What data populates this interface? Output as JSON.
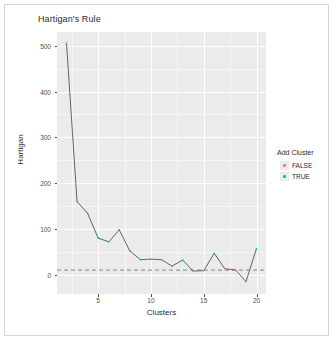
{
  "chart_data": {
    "type": "line",
    "title": "Hartigan's Rule",
    "xlabel": "Clusters",
    "ylabel": "Hartigan",
    "xlim": [
      1.1,
      20.9
    ],
    "ylim": [
      -42,
      530
    ],
    "xticks": [
      5,
      10,
      15,
      20
    ],
    "yticks": [
      0,
      100,
      200,
      300,
      400,
      500
    ],
    "grid": true,
    "legend": {
      "title": "Add Cluster",
      "position": "right",
      "entries": [
        {
          "label": "FALSE",
          "color": "#f8766d"
        },
        {
          "label": "TRUE",
          "color": "#00bfc4"
        }
      ]
    },
    "reference_line": {
      "y": 10,
      "style": "dashed",
      "color": "#999999"
    },
    "line_color": "#555555",
    "x": [
      2,
      3,
      4,
      5,
      6,
      7,
      8,
      9,
      10,
      11,
      12,
      13,
      14,
      15,
      16,
      17,
      18,
      19,
      20
    ],
    "values": [
      505,
      160,
      134,
      80,
      72,
      98,
      52,
      33,
      34,
      33,
      19,
      32,
      8,
      9,
      47,
      13,
      11,
      -15,
      57
    ],
    "series": [
      {
        "name": "Hartigan",
        "values": [
          505,
          160,
          134,
          80,
          72,
          98,
          52,
          33,
          34,
          33,
          19,
          32,
          8,
          9,
          47,
          13,
          11,
          -15,
          57
        ]
      }
    ],
    "point_groups": [
      {
        "add_cluster": "TRUE",
        "x": [
          2,
          3,
          4,
          5,
          6,
          7,
          8,
          9,
          10,
          11,
          12,
          13,
          16,
          20
        ],
        "color": "#00bfc4"
      },
      {
        "add_cluster": "FALSE",
        "x": [
          14,
          15,
          17,
          18,
          19
        ],
        "color": "#f8766d"
      }
    ]
  },
  "panel": {
    "background": "#ebebeb",
    "gridline_color": "#ffffff"
  }
}
